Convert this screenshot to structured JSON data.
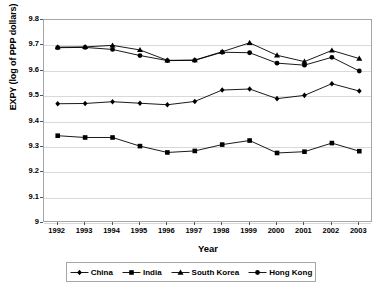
{
  "chart_data": {
    "type": "line",
    "title": "",
    "xlabel": "Year",
    "ylabel": "EXPY (log of PPP dollars)",
    "categories": [
      1992,
      1993,
      1994,
      1995,
      1996,
      1997,
      1998,
      1999,
      2000,
      2001,
      2002,
      2003
    ],
    "x_tick_labels": [
      "1992",
      "1993",
      "1994",
      "1995",
      "1996",
      "1997",
      "1998",
      "1999",
      "2000",
      "2001",
      "2002",
      "2003"
    ],
    "y_tick_labels": [
      "9.8",
      "9.7",
      "9.6",
      "9.5",
      "9.4",
      "9.3",
      "9.2",
      "9.1",
      "9"
    ],
    "y_ticks": [
      9.8,
      9.7,
      9.6,
      9.5,
      9.4,
      9.3,
      9.2,
      9.1,
      9.0
    ],
    "ylim": [
      9.0,
      9.8
    ],
    "grid": "horizontal",
    "legend_position": "bottom",
    "series": [
      {
        "name": "China",
        "marker": "diamond",
        "color": "#000000",
        "values": [
          9.47,
          9.471,
          9.478,
          9.472,
          9.466,
          9.479,
          9.524,
          9.528,
          9.49,
          9.503,
          9.549,
          9.52
        ]
      },
      {
        "name": "India",
        "marker": "square",
        "color": "#000000",
        "values": [
          9.344,
          9.337,
          9.337,
          9.303,
          9.278,
          9.284,
          9.309,
          9.325,
          9.276,
          9.281,
          9.315,
          9.283
        ]
      },
      {
        "name": "South Korea",
        "marker": "triangle",
        "color": "#000000",
        "values": [
          9.693,
          9.694,
          9.7,
          9.682,
          9.641,
          9.642,
          9.675,
          9.71,
          9.661,
          9.636,
          9.68,
          9.648
        ]
      },
      {
        "name": "Hong Kong",
        "marker": "circle",
        "color": "#000000",
        "values": [
          9.691,
          9.692,
          9.684,
          9.66,
          9.64,
          9.641,
          9.673,
          9.671,
          9.63,
          9.622,
          9.653,
          9.599
        ]
      }
    ]
  },
  "legend": {
    "items": [
      {
        "label": "China",
        "marker": "diamond"
      },
      {
        "label": "India",
        "marker": "square"
      },
      {
        "label": "South Korea",
        "marker": "triangle"
      },
      {
        "label": "Hong Kong",
        "marker": "circle"
      }
    ]
  },
  "style": {
    "line_color": "#000000",
    "grid_color": "#d9d9d9",
    "axis_color": "#a6a6a6",
    "background": "#ffffff"
  }
}
